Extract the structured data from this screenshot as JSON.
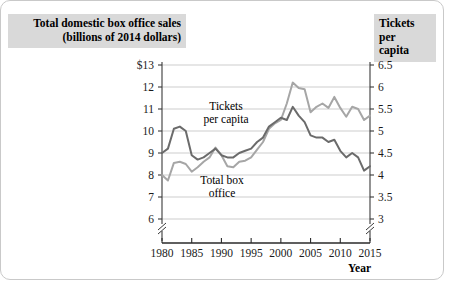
{
  "figure": {
    "left_axis_title": "Total domestic box office sales\n(billions of 2014 dollars)",
    "left_axis_title_line1": "Total domestic box office sales",
    "left_axis_title_line2": "(billions of 2014 dollars)",
    "right_axis_title_line1": "Tickets per",
    "right_axis_title_line2": "capita",
    "xaxis_title": "Year",
    "annotation_tickets_line1": "Tickets",
    "annotation_tickets_line2": "per capita",
    "annotation_boxoffice_line1": "Total box",
    "annotation_boxoffice_line2": "office",
    "colors": {
      "box_office_line": "#a6a6a6",
      "tickets_line": "#6b6b6b",
      "gridline": "#c0c0c0",
      "axis": "#3a3a3a",
      "title_band_bg": "#d9d9d9",
      "frame": "#c9c9c9"
    }
  },
  "chart_data": {
    "type": "line",
    "title": "",
    "xlabel": "Year",
    "grid": true,
    "legend": "inline-annotations",
    "x": [
      1980,
      1981,
      1982,
      1983,
      1984,
      1985,
      1986,
      1987,
      1988,
      1989,
      1990,
      1991,
      1992,
      1993,
      1994,
      1995,
      1996,
      1997,
      1998,
      1999,
      2000,
      2001,
      2002,
      2003,
      2004,
      2005,
      2006,
      2007,
      2008,
      2009,
      2010,
      2011,
      2012,
      2013,
      2014,
      2015
    ],
    "xticks": [
      1980,
      1985,
      1990,
      1995,
      2000,
      2005,
      2010,
      2015
    ],
    "xlim": [
      1980,
      2015
    ],
    "left_axis": {
      "label": "Total domestic box office sales (billions of 2014 dollars)",
      "ticks": [
        "$13",
        "12",
        "11",
        "10",
        "9",
        "8",
        "7",
        "6"
      ],
      "tick_values": [
        13,
        12,
        11,
        10,
        9,
        8,
        7,
        6
      ],
      "ylim": [
        6,
        13
      ],
      "axis_break": true
    },
    "right_axis": {
      "label": "Tickets per capita",
      "ticks": [
        "6.5",
        "6",
        "5.5",
        "5",
        "4.5",
        "4",
        "3.5",
        "3"
      ],
      "tick_values": [
        6.5,
        6,
        5.5,
        5,
        4.5,
        4,
        3.5,
        3
      ],
      "ylim": [
        3,
        6.5
      ],
      "axis_break": true
    },
    "series": [
      {
        "name": "Total box office",
        "axis": "left",
        "unit": "billions of 2014 dollars",
        "color": "#a6a6a6",
        "values": [
          8.0,
          7.75,
          8.55,
          8.6,
          8.5,
          8.15,
          8.35,
          8.6,
          8.8,
          9.25,
          8.9,
          8.4,
          8.35,
          8.6,
          8.65,
          8.8,
          9.15,
          9.5,
          10.1,
          10.35,
          10.5,
          11.25,
          12.2,
          11.95,
          11.9,
          10.85,
          11.1,
          11.25,
          11.05,
          11.55,
          11.05,
          10.65,
          11.1,
          11.0,
          10.5,
          10.7
        ]
      },
      {
        "name": "Tickets per capita",
        "axis": "right",
        "unit": "tickets per capita",
        "color": "#6b6b6b",
        "values": [
          4.5,
          4.6,
          5.05,
          5.1,
          5.0,
          4.45,
          4.35,
          4.4,
          4.5,
          4.6,
          4.45,
          4.4,
          4.4,
          4.5,
          4.55,
          4.6,
          4.75,
          4.85,
          5.1,
          5.2,
          5.3,
          5.25,
          5.55,
          5.35,
          5.2,
          4.9,
          4.85,
          4.85,
          4.75,
          4.8,
          4.55,
          4.4,
          4.5,
          4.4,
          4.1,
          4.2
        ]
      }
    ]
  }
}
